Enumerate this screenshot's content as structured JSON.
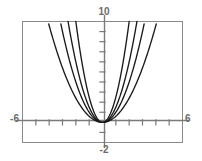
{
  "chart_data": {
    "type": "line",
    "title": "",
    "subtitle": "",
    "xlabel": "",
    "ylabel": "",
    "xlim": [
      -6,
      6
    ],
    "ylim": [
      -2,
      10
    ],
    "grid": false,
    "legend": "none",
    "axis_labels": {
      "top": "10",
      "bottom": "-2",
      "left": "-6",
      "right": "6"
    },
    "tick_labels": {
      "x": [
        "-6",
        "6"
      ],
      "y": [
        "10",
        "-2"
      ]
    },
    "x_tick_step": 1,
    "y_tick_step": 1,
    "vertex": [
      0,
      0
    ],
    "series": [
      {
        "name": "y = 0.6x^2",
        "coefficient": 0.6,
        "color": "#1a1a1a",
        "x": [
          -4.08,
          -3.5,
          -3,
          -2.5,
          -2,
          -1.5,
          -1,
          -0.5,
          0,
          0.5,
          1,
          1.5,
          2,
          2.5,
          3,
          3.5,
          4.08
        ],
        "values": [
          10,
          7.35,
          5.4,
          3.75,
          2.4,
          1.35,
          0.6,
          0.15,
          0,
          0.15,
          0.6,
          1.35,
          2.4,
          3.75,
          5.4,
          7.35,
          10
        ]
      },
      {
        "name": "y = 1.0x^2",
        "coefficient": 1.0,
        "color": "#1a1a1a",
        "x": [
          -3.16,
          -3,
          -2.5,
          -2,
          -1.5,
          -1,
          -0.5,
          0,
          0.5,
          1,
          1.5,
          2,
          2.5,
          3,
          3.16
        ],
        "values": [
          10,
          9,
          6.25,
          4,
          2.25,
          1,
          0.25,
          0,
          0.25,
          1,
          2.25,
          4,
          6.25,
          9,
          10
        ]
      },
      {
        "name": "y = 1.5x^2",
        "coefficient": 1.5,
        "color": "#1a1a1a",
        "x": [
          -2.58,
          -2.25,
          -2,
          -1.75,
          -1.5,
          -1,
          -0.5,
          0,
          0.5,
          1,
          1.5,
          1.75,
          2,
          2.25,
          2.58
        ],
        "values": [
          10,
          7.59,
          6,
          4.59,
          3.375,
          1.5,
          0.375,
          0,
          0.375,
          1.5,
          3.375,
          4.59,
          6,
          7.59,
          10
        ]
      },
      {
        "name": "y = 2.5x^2",
        "coefficient": 2.5,
        "color": "#1a1a1a",
        "x": [
          -2,
          -1.75,
          -1.5,
          -1.25,
          -1,
          -0.75,
          -0.5,
          -0.25,
          0,
          0.25,
          0.5,
          0.75,
          1,
          1.25,
          1.5,
          1.75,
          2
        ],
        "values": [
          10,
          7.66,
          5.625,
          3.91,
          2.5,
          1.41,
          0.625,
          0.156,
          0,
          0.156,
          0.625,
          1.41,
          2.5,
          3.91,
          5.625,
          7.66,
          10
        ]
      }
    ],
    "colors": {
      "curve": "#1a1a1a",
      "axis": "#7a7a7a",
      "frame": "#8a8a8a",
      "label": "#6b6b6b",
      "background": "#ffffff"
    }
  }
}
